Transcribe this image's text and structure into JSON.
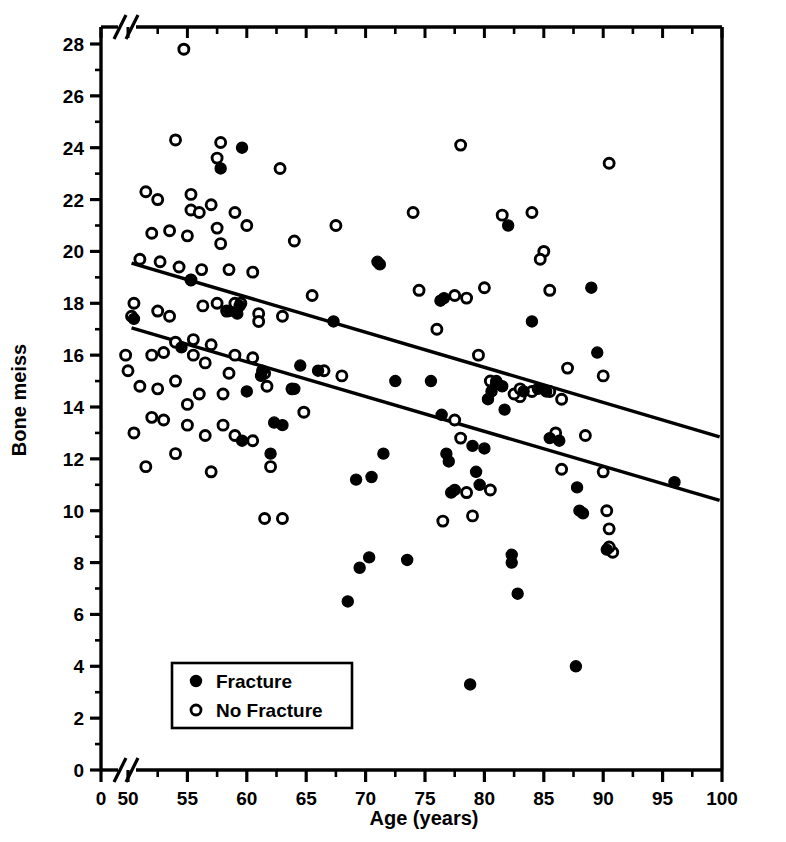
{
  "chart_data": {
    "type": "scatter",
    "title": "",
    "xlabel": "Age (years)",
    "ylabel": "Bone meiss",
    "xlim": [
      48,
      100
    ],
    "ylim": [
      0,
      29
    ],
    "x_ticks_major": [
      0,
      50,
      55,
      60,
      65,
      70,
      75,
      80,
      85,
      90,
      95,
      100
    ],
    "x_tick_labels": [
      "0",
      "50",
      "55",
      "60",
      "65",
      "70",
      "75",
      "80",
      "85",
      "90",
      "95",
      "100"
    ],
    "x_minor_step": 2.5,
    "y_ticks_major": [
      0,
      2,
      4,
      6,
      8,
      10,
      12,
      14,
      16,
      18,
      20,
      22,
      24,
      26,
      28
    ],
    "y_tick_labels": [
      "0",
      "2",
      "4",
      "6",
      "8",
      "10",
      "12",
      "14",
      "16",
      "18",
      "20",
      "22",
      "24",
      "26",
      "28"
    ],
    "axis_break_x": true,
    "axis_break_y": true,
    "grid": false,
    "legend_position": "lower-left",
    "series": [
      {
        "name": "Fracture",
        "marker": "filled-circle",
        "color": "#000000",
        "points": [
          [
            50.5,
            17.4
          ],
          [
            54.5,
            16.3
          ],
          [
            57.8,
            23.2
          ],
          [
            59.6,
            24.0
          ],
          [
            59.4,
            17.9
          ],
          [
            59.2,
            17.6
          ],
          [
            60.0,
            14.6
          ],
          [
            61.3,
            15.4
          ],
          [
            61.2,
            15.2
          ],
          [
            59.6,
            12.7
          ],
          [
            62.3,
            13.4
          ],
          [
            63.0,
            13.3
          ],
          [
            62.0,
            12.2
          ],
          [
            64.5,
            15.6
          ],
          [
            66.0,
            15.4
          ],
          [
            67.3,
            17.3
          ],
          [
            68.5,
            6.5
          ],
          [
            69.2,
            11.2
          ],
          [
            69.5,
            7.8
          ],
          [
            70.3,
            8.2
          ],
          [
            70.5,
            11.3
          ],
          [
            71.0,
            19.6
          ],
          [
            71.2,
            19.5
          ],
          [
            71.5,
            12.2
          ],
          [
            72.5,
            15.0
          ],
          [
            73.5,
            8.1
          ],
          [
            76.3,
            18.1
          ],
          [
            76.6,
            18.2
          ],
          [
            76.4,
            13.7
          ],
          [
            76.8,
            12.2
          ],
          [
            77.0,
            11.9
          ],
          [
            77.2,
            10.7
          ],
          [
            77.5,
            10.8
          ],
          [
            78.8,
            3.3
          ],
          [
            79.0,
            12.5
          ],
          [
            79.3,
            11.5
          ],
          [
            79.6,
            11.0
          ],
          [
            80.0,
            12.4
          ],
          [
            80.3,
            14.3
          ],
          [
            80.6,
            14.6
          ],
          [
            81.0,
            15.0
          ],
          [
            81.5,
            14.8
          ],
          [
            81.7,
            13.9
          ],
          [
            82.0,
            21.0
          ],
          [
            82.3,
            8.3
          ],
          [
            82.3,
            8.0
          ],
          [
            82.8,
            6.8
          ],
          [
            83.3,
            14.6
          ],
          [
            84.0,
            17.3
          ],
          [
            84.5,
            14.7
          ],
          [
            85.2,
            14.6
          ],
          [
            85.5,
            12.8
          ],
          [
            86.3,
            12.7
          ],
          [
            87.7,
            4.0
          ],
          [
            87.8,
            10.9
          ],
          [
            88.0,
            10.0
          ],
          [
            88.3,
            9.9
          ],
          [
            89.0,
            18.6
          ],
          [
            89.5,
            16.1
          ],
          [
            90.3,
            8.5
          ],
          [
            96.0,
            11.1
          ],
          [
            55.3,
            18.9
          ],
          [
            58.5,
            17.7
          ],
          [
            64.0,
            14.7
          ],
          [
            75.5,
            15.0
          ]
        ]
      },
      {
        "name": "No Fracture",
        "marker": "open-circle",
        "color": "#000000",
        "points": [
          [
            54.7,
            27.8
          ],
          [
            54.0,
            24.3
          ],
          [
            57.8,
            24.2
          ],
          [
            57.5,
            23.6
          ],
          [
            62.8,
            23.2
          ],
          [
            51.5,
            22.3
          ],
          [
            52.5,
            22.0
          ],
          [
            55.3,
            22.2
          ],
          [
            55.3,
            21.6
          ],
          [
            56.0,
            21.5
          ],
          [
            57.0,
            21.8
          ],
          [
            59.0,
            21.5
          ],
          [
            60.0,
            21.0
          ],
          [
            67.5,
            21.0
          ],
          [
            52.0,
            20.7
          ],
          [
            53.5,
            20.8
          ],
          [
            55.0,
            20.6
          ],
          [
            57.5,
            20.9
          ],
          [
            57.8,
            20.3
          ],
          [
            64.0,
            20.4
          ],
          [
            51.0,
            19.7
          ],
          [
            52.7,
            19.6
          ],
          [
            54.3,
            19.4
          ],
          [
            55.3,
            18.9
          ],
          [
            56.2,
            19.3
          ],
          [
            58.5,
            19.3
          ],
          [
            60.5,
            19.2
          ],
          [
            74.0,
            21.5
          ],
          [
            78.0,
            24.1
          ],
          [
            81.5,
            21.4
          ],
          [
            84.0,
            21.5
          ],
          [
            85.0,
            20.0
          ],
          [
            84.7,
            19.7
          ],
          [
            90.5,
            23.4
          ],
          [
            50.5,
            18.0
          ],
          [
            50.3,
            17.5
          ],
          [
            52.5,
            17.7
          ],
          [
            53.5,
            17.5
          ],
          [
            55.5,
            16.6
          ],
          [
            56.3,
            17.9
          ],
          [
            57.5,
            18.0
          ],
          [
            58.3,
            17.7
          ],
          [
            59.0,
            18.0
          ],
          [
            59.5,
            18.0
          ],
          [
            61.0,
            17.6
          ],
          [
            65.5,
            18.3
          ],
          [
            74.5,
            18.5
          ],
          [
            77.5,
            18.3
          ],
          [
            78.5,
            18.2
          ],
          [
            80.0,
            18.6
          ],
          [
            85.5,
            18.5
          ],
          [
            49.8,
            16.0
          ],
          [
            50.0,
            15.4
          ],
          [
            52.0,
            16.0
          ],
          [
            53.0,
            16.1
          ],
          [
            54.0,
            16.5
          ],
          [
            55.5,
            16.0
          ],
          [
            56.5,
            15.7
          ],
          [
            57.0,
            16.4
          ],
          [
            59.0,
            16.0
          ],
          [
            60.5,
            15.9
          ],
          [
            61.0,
            17.3
          ],
          [
            63.0,
            17.5
          ],
          [
            76.0,
            17.0
          ],
          [
            79.5,
            16.0
          ],
          [
            87.0,
            15.5
          ],
          [
            90.0,
            15.2
          ],
          [
            51.0,
            14.8
          ],
          [
            52.5,
            14.7
          ],
          [
            54.0,
            15.0
          ],
          [
            55.0,
            14.1
          ],
          [
            56.0,
            14.5
          ],
          [
            58.0,
            14.5
          ],
          [
            58.5,
            15.3
          ],
          [
            61.5,
            15.3
          ],
          [
            61.7,
            14.8
          ],
          [
            63.8,
            14.7
          ],
          [
            66.5,
            15.4
          ],
          [
            68.0,
            15.2
          ],
          [
            80.5,
            15.0
          ],
          [
            81.0,
            14.9
          ],
          [
            83.0,
            14.4
          ],
          [
            84.0,
            14.6
          ],
          [
            85.5,
            14.6
          ],
          [
            86.5,
            14.3
          ],
          [
            50.5,
            13.0
          ],
          [
            52.0,
            13.6
          ],
          [
            53.0,
            13.5
          ],
          [
            55.0,
            13.3
          ],
          [
            56.5,
            12.9
          ],
          [
            58.0,
            13.3
          ],
          [
            59.0,
            12.9
          ],
          [
            60.5,
            12.7
          ],
          [
            62.0,
            11.7
          ],
          [
            64.8,
            13.8
          ],
          [
            77.5,
            13.5
          ],
          [
            78.0,
            12.8
          ],
          [
            86.0,
            13.0
          ],
          [
            88.5,
            12.9
          ],
          [
            51.5,
            11.7
          ],
          [
            54.0,
            12.2
          ],
          [
            57.0,
            11.5
          ],
          [
            61.5,
            9.7
          ],
          [
            76.5,
            9.6
          ],
          [
            78.5,
            10.7
          ],
          [
            79.0,
            9.8
          ],
          [
            80.5,
            10.8
          ],
          [
            86.5,
            11.6
          ],
          [
            90.0,
            11.5
          ],
          [
            90.3,
            10.0
          ],
          [
            90.5,
            9.3
          ],
          [
            90.8,
            8.4
          ],
          [
            90.5,
            8.6
          ],
          [
            63.0,
            9.7
          ],
          [
            82.5,
            14.5
          ],
          [
            83.0,
            14.7
          ]
        ]
      }
    ],
    "trend_lines": [
      {
        "name": "no-fracture-trend",
        "label": "No Fracture regression",
        "x_start": 50.3,
        "y_start": 19.55,
        "x_end": 99.8,
        "y_end": 12.85
      },
      {
        "name": "fracture-trend",
        "label": "Fracture regression",
        "x_start": 50.3,
        "y_start": 17.05,
        "x_end": 99.8,
        "y_end": 10.4
      }
    ]
  },
  "legend": {
    "items": [
      {
        "label": "Fracture",
        "marker": "filled-circle"
      },
      {
        "label": "No Fracture",
        "marker": "open-circle"
      }
    ]
  },
  "axes": {
    "x_title": "Age (years)",
    "y_title": "Bone meiss"
  }
}
